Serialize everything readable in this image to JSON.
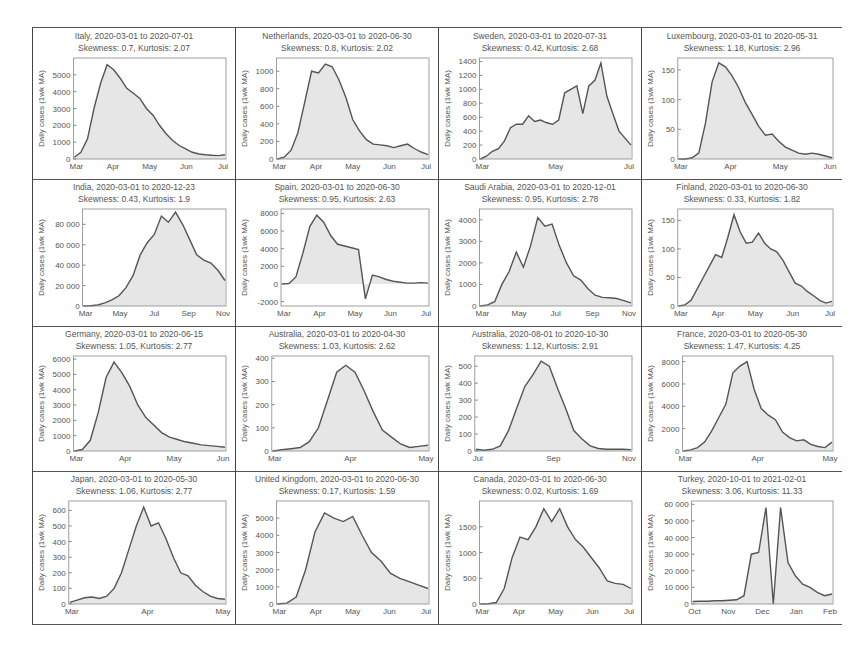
{
  "figure": {
    "ylabel": "Daily cases (1wk MA)",
    "colors": {
      "line": "#555555",
      "fill": "#e6e6e6",
      "frame": "#888888",
      "grid_border": "#444444"
    }
  },
  "chart_data": [
    {
      "type": "area",
      "title": "Italy, 2020-03-01 to 2020-07-01",
      "subtitle": "Skewness: 0.7, Kurtosis: 2.07",
      "ylabel": "Daily cases (1wk MA)",
      "ylim": [
        0,
        6000
      ],
      "yticks": [
        0,
        1000,
        2000,
        3000,
        4000,
        5000
      ],
      "ytick_labels": [
        "0",
        "1000",
        "2000",
        "3000",
        "4000",
        "5000"
      ],
      "xticks": [
        "Mar",
        "Apr",
        "May",
        "Jun",
        "Jul"
      ],
      "values": [
        100,
        400,
        1200,
        3000,
        4500,
        5600,
        5300,
        4800,
        4200,
        3900,
        3600,
        3000,
        2600,
        2000,
        1500,
        1100,
        800,
        600,
        400,
        300,
        250,
        220,
        200,
        250
      ]
    },
    {
      "type": "area",
      "title": "Netherlands, 2020-03-01 to 2020-06-30",
      "subtitle": "Skewness: 0.8, Kurtosis: 2.02",
      "ylabel": "Daily cases (1wk MA)",
      "ylim": [
        0,
        1150
      ],
      "yticks": [
        0,
        200,
        400,
        600,
        800,
        1000
      ],
      "ytick_labels": [
        "0",
        "200",
        "400",
        "600",
        "800",
        "1000"
      ],
      "xticks": [
        "Mar",
        "Apr",
        "May",
        "Jun",
        "Jul"
      ],
      "values": [
        0,
        20,
        100,
        300,
        650,
        1000,
        980,
        1080,
        1050,
        900,
        700,
        450,
        320,
        220,
        170,
        160,
        150,
        130,
        150,
        170,
        120,
        80,
        50
      ]
    },
    {
      "type": "area",
      "title": "Sweden, 2020-03-01 to 2020-07-31",
      "subtitle": "Skewness: 0.42, Kurtosis: 2.68",
      "ylabel": "Daily cases (1wk MA)",
      "ylim": [
        0,
        1450
      ],
      "yticks": [
        0,
        200,
        400,
        600,
        800,
        1000,
        1200,
        1400
      ],
      "ytick_labels": [
        "0",
        "200",
        "400",
        "600",
        "800",
        "1000",
        "1200",
        "1400"
      ],
      "xticks": [
        "Mar",
        "May",
        "Jul"
      ],
      "values": [
        0,
        40,
        110,
        150,
        260,
        450,
        500,
        500,
        620,
        540,
        560,
        520,
        500,
        560,
        950,
        1000,
        1050,
        650,
        1050,
        1130,
        1380,
        900,
        650,
        400,
        300,
        200
      ]
    },
    {
      "type": "area",
      "title": "Luxembourg, 2020-03-01 to 2020-05-31",
      "subtitle": "Skewness: 1.18, Kurtosis: 2.96",
      "ylabel": "Daily cases (1wk MA)",
      "ylim": [
        0,
        170
      ],
      "yticks": [
        0,
        50,
        100,
        150
      ],
      "ytick_labels": [
        "0",
        "50",
        "100",
        "150"
      ],
      "xticks": [
        "Mar",
        "Apr",
        "May",
        "Jun"
      ],
      "values": [
        0,
        0,
        2,
        10,
        60,
        130,
        162,
        155,
        140,
        120,
        95,
        75,
        55,
        40,
        42,
        30,
        20,
        15,
        10,
        8,
        10,
        8,
        5,
        2
      ]
    },
    {
      "type": "area",
      "title": "India, 2020-03-01 to 2020-12-23",
      "subtitle": "Skewness: 0.43, Kurtosis: 1.9",
      "ylabel": "Daily cases (1wk MA)",
      "ylim": [
        0,
        95000
      ],
      "yticks": [
        0,
        20000,
        40000,
        60000,
        80000
      ],
      "ytick_labels": [
        "0",
        "20 000",
        "40 000",
        "60 000",
        "80 000"
      ],
      "xticks": [
        "Mar",
        "May",
        "Jul",
        "Sep",
        "Nov"
      ],
      "values": [
        0,
        200,
        1000,
        3000,
        6000,
        10000,
        18000,
        30000,
        50000,
        62000,
        70000,
        88000,
        82000,
        92000,
        80000,
        65000,
        50000,
        45000,
        42000,
        35000,
        25000
      ]
    },
    {
      "type": "area",
      "title": "Spain, 2020-03-01 to 2020-06-30",
      "subtitle": "Skewness: 0.95, Kurtosis: 2.63",
      "ylabel": "Daily cases (1wk MA)",
      "ylim": [
        -2500,
        8500
      ],
      "yticks": [
        -2000,
        0,
        2000,
        4000,
        6000,
        8000
      ],
      "ytick_labels": [
        "-2000",
        "0",
        "2000",
        "4000",
        "6000",
        "8000"
      ],
      "xticks": [
        "Mar",
        "Apr",
        "May",
        "Jun",
        "Jul"
      ],
      "values": [
        0,
        50,
        800,
        3500,
        6500,
        7800,
        7000,
        5500,
        4500,
        4300,
        4100,
        3900,
        -1700,
        1000,
        800,
        500,
        300,
        200,
        100,
        100,
        150,
        100
      ]
    },
    {
      "type": "area",
      "title": "Saudi Arabia, 2020-03-01 to 2020-12-01",
      "subtitle": "Skewness: 0.95, Kurtosis: 2.78",
      "ylabel": "Daily cases (1wk MA)",
      "ylim": [
        0,
        4500
      ],
      "yticks": [
        0,
        1000,
        2000,
        3000,
        4000
      ],
      "ytick_labels": [
        "0",
        "1000",
        "2000",
        "3000",
        "4000"
      ],
      "xticks": [
        "Mar",
        "May",
        "Jul",
        "Sep",
        "Nov"
      ],
      "values": [
        0,
        50,
        200,
        1000,
        1600,
        2500,
        1800,
        2800,
        4100,
        3700,
        3800,
        2800,
        2000,
        1400,
        1200,
        800,
        500,
        400,
        380,
        350,
        250,
        150
      ]
    },
    {
      "type": "area",
      "title": "Finland, 2020-03-01 to 2020-06-30",
      "subtitle": "Skewness: 0.33, Kurtosis: 1.82",
      "ylabel": "Daily cases (1wk MA)",
      "ylim": [
        0,
        170
      ],
      "yticks": [
        0,
        50,
        100,
        150
      ],
      "ytick_labels": [
        "0",
        "50",
        "100",
        "150"
      ],
      "xticks": [
        "Mar",
        "Apr",
        "May",
        "Jun",
        "Jul"
      ],
      "values": [
        0,
        2,
        10,
        30,
        50,
        70,
        90,
        85,
        120,
        160,
        130,
        110,
        112,
        128,
        110,
        100,
        95,
        80,
        60,
        40,
        35,
        25,
        18,
        10,
        5,
        8
      ]
    },
    {
      "type": "area",
      "title": "Germany, 2020-03-01 to 2020-06-15",
      "subtitle": "Skewness: 1.05, Kurtosis: 2.77",
      "ylabel": "Daily cases (1wk MA)",
      "ylim": [
        0,
        6200
      ],
      "yticks": [
        0,
        1000,
        2000,
        3000,
        4000,
        5000,
        6000
      ],
      "ytick_labels": [
        "0",
        "1000",
        "2000",
        "3000",
        "4000",
        "5000",
        "6000"
      ],
      "xticks": [
        "Mar",
        "Apr",
        "May",
        "Jun"
      ],
      "values": [
        0,
        100,
        700,
        2500,
        4800,
        5800,
        5100,
        4200,
        3000,
        2200,
        1700,
        1200,
        900,
        750,
        600,
        500,
        400,
        350,
        300,
        250
      ]
    },
    {
      "type": "area",
      "title": "Australia, 2020-03-01 to 2020-04-30",
      "subtitle": "Skewness: 1.03, Kurtosis: 2.62",
      "ylabel": "Daily cases (1wk MA)",
      "ylim": [
        0,
        410
      ],
      "yticks": [
        0,
        100,
        200,
        300,
        400
      ],
      "ytick_labels": [
        "0",
        "100",
        "200",
        "300",
        "400"
      ],
      "xticks": [
        "Mar",
        "Apr",
        "May"
      ],
      "values": [
        0,
        5,
        10,
        15,
        40,
        100,
        220,
        340,
        370,
        340,
        260,
        170,
        90,
        60,
        30,
        15,
        20,
        25
      ]
    },
    {
      "type": "area",
      "title": "Australia, 2020-08-01 to 2020-10-30",
      "subtitle": "Skewness: 1.12, Kurtosis: 2.91",
      "ylabel": "Daily cases (1wk MA)",
      "ylim": [
        0,
        560
      ],
      "yticks": [
        0,
        100,
        200,
        300,
        400,
        500
      ],
      "ytick_labels": [
        "0",
        "100",
        "200",
        "300",
        "400",
        "500"
      ],
      "xticks": [
        "Jul",
        "Sep",
        "Nov"
      ],
      "values": [
        10,
        5,
        10,
        30,
        120,
        250,
        380,
        450,
        530,
        500,
        370,
        250,
        120,
        70,
        30,
        15,
        10,
        10,
        10,
        8
      ]
    },
    {
      "type": "area",
      "title": "France, 2020-03-01 to 2020-05-30",
      "subtitle": "Skewness: 1.47, Kurtosis: 4.25",
      "ylabel": "Daily cases (1wk MA)",
      "ylim": [
        0,
        8500
      ],
      "yticks": [
        0,
        2000,
        4000,
        6000,
        8000
      ],
      "ytick_labels": [
        "0",
        "2000",
        "4000",
        "6000",
        "8000"
      ],
      "xticks": [
        "Mar",
        "Apr",
        "May"
      ],
      "values": [
        0,
        100,
        300,
        800,
        1800,
        3000,
        4200,
        7000,
        7600,
        8000,
        5500,
        3800,
        3200,
        2800,
        1700,
        1200,
        900,
        1000,
        600,
        400,
        300,
        800
      ]
    },
    {
      "type": "area",
      "title": "Japan, 2020-03-01 to 2020-05-30",
      "subtitle": "Skewness: 1.06, Kurtosis: 2.77",
      "ylabel": "Daily cases (1wk MA)",
      "ylim": [
        0,
        660
      ],
      "yticks": [
        0,
        100,
        200,
        300,
        400,
        500,
        600
      ],
      "ytick_labels": [
        "0",
        "100",
        "200",
        "300",
        "400",
        "500",
        "600"
      ],
      "xticks": [
        "Mar",
        "Apr",
        "May"
      ],
      "values": [
        10,
        25,
        40,
        45,
        35,
        50,
        100,
        200,
        350,
        500,
        620,
        500,
        520,
        420,
        300,
        200,
        180,
        120,
        80,
        50,
        35,
        30
      ]
    },
    {
      "type": "area",
      "title": "United Kingdom, 2020-03-01 to 2020-06-30",
      "subtitle": "Skewness: 0.17, Kurtosis: 1.59",
      "ylabel": "Daily cases (1wk MA)",
      "ylim": [
        0,
        6000
      ],
      "yticks": [
        0,
        1000,
        2000,
        3000,
        4000,
        5000
      ],
      "ytick_labels": [
        "0",
        "1000",
        "2000",
        "3000",
        "4000",
        "5000"
      ],
      "xticks": [
        "Mar",
        "Apr",
        "May",
        "Jun",
        "Jul"
      ],
      "values": [
        0,
        50,
        400,
        2000,
        4200,
        5300,
        5000,
        4800,
        5100,
        4000,
        3000,
        2500,
        1800,
        1500,
        1300,
        1100,
        900
      ]
    },
    {
      "type": "area",
      "title": "Canada, 2020-03-01 to 2020-06-30",
      "subtitle": "Skewness: 0.02, Kurtosis: 1.69",
      "ylabel": "Daily cases (1wk MA)",
      "ylim": [
        0,
        2000
      ],
      "yticks": [
        0,
        500,
        1000,
        1500
      ],
      "ytick_labels": [
        "0",
        "500",
        "1000",
        "1500"
      ],
      "xticks": [
        "Mar",
        "Apr",
        "May",
        "Jun",
        "Jul"
      ],
      "values": [
        0,
        5,
        30,
        300,
        900,
        1300,
        1250,
        1500,
        1850,
        1600,
        1850,
        1500,
        1250,
        1100,
        900,
        700,
        450,
        400,
        380,
        300
      ]
    },
    {
      "type": "area",
      "title": "Turkey, 2020-10-01 to 2021-02-01",
      "subtitle": "Skewness: 3.06, Kurtosis: 11.33",
      "ylabel": "Daily cases (1wk MA)",
      "ylim": [
        0,
        62000
      ],
      "yticks": [
        0,
        10000,
        20000,
        30000,
        40000,
        50000,
        60000
      ],
      "ytick_labels": [
        "0",
        "10 000",
        "20 000",
        "30 000",
        "40 000",
        "50 000",
        "60 000"
      ],
      "xticks": [
        "Oct",
        "Nov",
        "Dec",
        "Jan",
        "Feb"
      ],
      "values": [
        1500,
        1600,
        1700,
        1900,
        2000,
        2200,
        2500,
        5000,
        30000,
        31000,
        58000,
        0,
        58000,
        25000,
        17000,
        12000,
        10000,
        7000,
        5000,
        6000
      ]
    }
  ]
}
